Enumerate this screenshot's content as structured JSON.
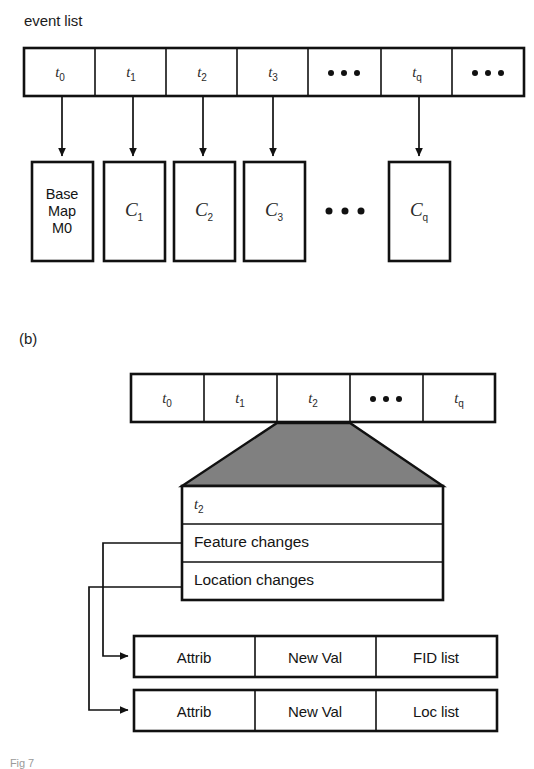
{
  "figure": {
    "panel_a_label": "event list",
    "panel_b_label": "(b)",
    "caption": "Fig 7",
    "ellipsis_glyph": "•••"
  },
  "colors": {
    "stroke": "#111111",
    "background": "#ffffff",
    "trapezoid_fill": "#808080",
    "text": "#141414"
  },
  "panel_a": {
    "event_list": {
      "label": "event list",
      "cells": [
        {
          "text": "t",
          "sub": "0",
          "kind": "time"
        },
        {
          "text": "t",
          "sub": "1",
          "kind": "time"
        },
        {
          "text": "t",
          "sub": "2",
          "kind": "time"
        },
        {
          "text": "t",
          "sub": "3",
          "kind": "time"
        },
        {
          "text": "•••",
          "sub": "",
          "kind": "ellipsis"
        },
        {
          "text": "t",
          "sub": "q",
          "kind": "time"
        },
        {
          "text": "•••",
          "sub": "",
          "kind": "ellipsis"
        }
      ]
    },
    "snapshots": [
      {
        "lines": [
          "Base",
          "Map",
          "M0"
        ],
        "kind": "basemap"
      },
      {
        "text": "C",
        "sub": "1",
        "kind": "change"
      },
      {
        "text": "C",
        "sub": "2",
        "kind": "change"
      },
      {
        "text": "C",
        "sub": "3",
        "kind": "change"
      },
      {
        "text": "•••",
        "sub": "",
        "kind": "ellipsis"
      },
      {
        "text": "C",
        "sub": "q",
        "kind": "change"
      }
    ]
  },
  "panel_b": {
    "label": "(b)",
    "event_list": {
      "cells": [
        {
          "text": "t",
          "sub": "0",
          "kind": "time"
        },
        {
          "text": "t",
          "sub": "1",
          "kind": "time"
        },
        {
          "text": "t",
          "sub": "2",
          "kind": "time"
        },
        {
          "text": "•••",
          "sub": "",
          "kind": "ellipsis"
        },
        {
          "text": "t",
          "sub": "q",
          "kind": "time"
        }
      ],
      "expanded_cell_index": 2
    },
    "detail_box": {
      "header": {
        "text": "t",
        "sub": "2"
      },
      "rows": [
        {
          "label": "Feature changes"
        },
        {
          "label": "Location changes"
        }
      ]
    },
    "tables": [
      {
        "name": "feature-changes-record",
        "columns": [
          "Attrib",
          "New Val",
          "FID list"
        ]
      },
      {
        "name": "location-changes-record",
        "columns": [
          "Attrib",
          "New Val",
          "Loc list"
        ]
      }
    ]
  }
}
